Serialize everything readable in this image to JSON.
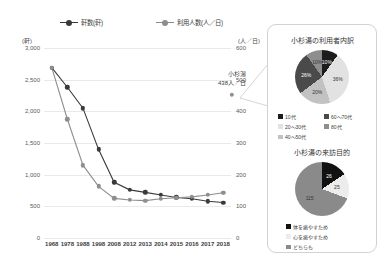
{
  "chart_data": [
    {
      "type": "line",
      "title": "",
      "xlabel": "",
      "ylabel": "軒",
      "unit_left": "(軒)",
      "unit_right": "(人／日)",
      "categories": [
        "1968",
        "1978",
        "1988",
        "1998",
        "2008",
        "2012",
        "2013",
        "2014",
        "2015",
        "2016",
        "2017",
        "2018"
      ],
      "ylim": [
        0,
        3000
      ],
      "y2lim": [
        0,
        600
      ],
      "yticks": [
        "0",
        "500",
        "1,000",
        "1,500",
        "2,000",
        "2,500",
        "3,000"
      ],
      "y2ticks": [
        "0",
        "100",
        "200",
        "300",
        "400",
        "500",
        "600"
      ],
      "grid": true,
      "legend_position": "top",
      "series": [
        {
          "name": "軒数(軒)",
          "axis": "left",
          "color": "#3a3a3a",
          "values": [
            2690,
            2380,
            2050,
            1400,
            880,
            760,
            720,
            680,
            640,
            620,
            580,
            560
          ]
        },
        {
          "name": "利用人数(人／日)",
          "axis": "right",
          "color": "#8e8e8e",
          "values": [
            538,
            375,
            230,
            163,
            125,
            120,
            118,
            124,
            127,
            130,
            136,
            143
          ]
        }
      ],
      "annotation": {
        "line1": "小杉湯",
        "line2": "438人／日",
        "value": 438
      }
    },
    {
      "type": "pie",
      "title": "小杉湯の利用者内訳",
      "labels": [
        "10代",
        "20〜30代",
        "40〜50代",
        "60〜70代",
        "80代"
      ],
      "values": [
        10,
        36,
        20,
        26,
        10
      ],
      "display_labels": [
        "10%",
        "36%",
        "20%",
        "26%",
        "10%"
      ],
      "colors": [
        "#1c1c1c",
        "#e2e2e2",
        "#c2c2c2",
        "#4a4a4a",
        "#8e8e8e"
      ],
      "legend_position": "bottom"
    },
    {
      "type": "pie",
      "title": "小杉湯の来訪目的",
      "labels": [
        "体を癒やすため",
        "心を癒やすため",
        "どちらも"
      ],
      "values": [
        26,
        25,
        115
      ],
      "display_labels": [
        "26",
        "25",
        "115"
      ],
      "colors": [
        "#111111",
        "#ececec",
        "#8a8a8a"
      ],
      "legend_position": "bottom"
    }
  ],
  "chart": {
    "legend": [
      {
        "label": "軒数(軒)"
      },
      {
        "label": "利用人数(人／日)"
      }
    ],
    "unit_left": "(軒)",
    "unit_right": "(人／日)",
    "yticks": [
      "3,000",
      "2,500",
      "2,000",
      "1,500",
      "1,000",
      "500",
      "0"
    ],
    "y2ticks": [
      "600",
      "500",
      "400",
      "300",
      "200",
      "100",
      "0"
    ],
    "xticks": [
      "1968",
      "1978",
      "1988",
      "1998",
      "2008",
      "2012",
      "2013",
      "2014",
      "2015",
      "2016",
      "2017",
      "2018"
    ],
    "annotation_line1": "小杉湯",
    "annotation_line2": "438人／日"
  },
  "pie_users": {
    "title": "小杉湯の利用者内訳",
    "slices": [
      {
        "label": "10代",
        "display": "10%",
        "color": "#1c1c1c"
      },
      {
        "label": "20〜30代",
        "display": "36%",
        "color": "#e2e2e2"
      },
      {
        "label": "40〜50代",
        "display": "20%",
        "color": "#c2c2c2"
      },
      {
        "label": "60〜70代",
        "display": "26%",
        "color": "#4a4a4a"
      },
      {
        "label": "80代",
        "display": "10%",
        "color": "#8e8e8e"
      }
    ],
    "legend": [
      "10代",
      "60〜70代",
      "20〜30代",
      "80代",
      "40〜50代"
    ]
  },
  "pie_purpose": {
    "title": "小杉湯の来訪目的",
    "slices": [
      {
        "label": "体を癒やすため",
        "display": "26",
        "color": "#111111"
      },
      {
        "label": "心を癒やすため",
        "display": "25",
        "color": "#ececec"
      },
      {
        "label": "どちらも",
        "display": "115",
        "color": "#8a8a8a"
      }
    ],
    "legend": [
      "体を癒やすため",
      "心を癒やすため",
      "どちらも"
    ]
  }
}
